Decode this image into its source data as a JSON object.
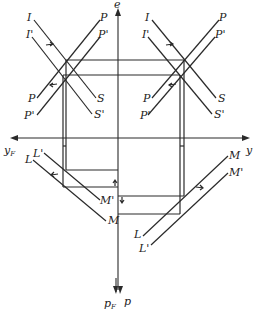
{
  "diagram": {
    "type": "economic-four-quadrant-diagram",
    "axes": {
      "vertical_label": "e",
      "horizontal_right_label": "y",
      "horizontal_left_label": "y",
      "horizontal_left_sub": "F",
      "bottom_left_label": "p",
      "bottom_left_sub": "F",
      "bottom_right_label": "p"
    },
    "top_left_panel": {
      "curves": [
        {
          "start": "I",
          "end": "S"
        },
        {
          "start": "I'",
          "end": "S'"
        },
        {
          "start": "P",
          "end": "P"
        },
        {
          "start": "P'",
          "end": "P'"
        }
      ]
    },
    "top_right_panel": {
      "curves": [
        {
          "start": "I",
          "end": "S"
        },
        {
          "start": "I'",
          "end": "S'"
        },
        {
          "start": "P",
          "end": "P"
        },
        {
          "start": "P'",
          "end": "P'"
        }
      ]
    },
    "bottom_left_panel": {
      "curves": [
        {
          "start": "L",
          "end": "M"
        },
        {
          "start": "L'",
          "end": "M'"
        }
      ]
    },
    "bottom_right_panel": {
      "curves": [
        {
          "start": "M",
          "end": "L"
        },
        {
          "start": "M'",
          "end": "L'"
        }
      ]
    },
    "colors": {
      "line": "#2a2a2a",
      "background": "#ffffff"
    }
  }
}
